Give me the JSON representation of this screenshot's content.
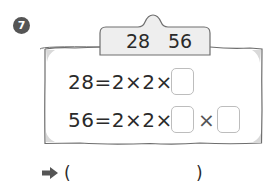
{
  "problem": {
    "number": "7",
    "tab": {
      "left_value": "28",
      "right_value": "56"
    },
    "rows": [
      {
        "expression": "28=2×2×",
        "blank_count": 1
      },
      {
        "expression": "56=2×2×",
        "blank_count": 2,
        "separator": "×"
      }
    ],
    "answer": {
      "arrow_icon": "right-arrow-icon",
      "open_paren": "(",
      "close_paren": ")",
      "value": ""
    }
  },
  "colors": {
    "badge": "#555555",
    "frame_border": "#6e6e6e",
    "tab_fill": "#eeeeee",
    "box_border": "#bdbdbd"
  }
}
